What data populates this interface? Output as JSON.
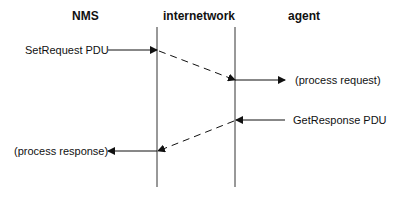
{
  "columns": {
    "nms": "NMS",
    "internetwork": "internetwork",
    "agent": "agent"
  },
  "messages": {
    "set_request": "SetRequest PDU",
    "process_request": "(process request)",
    "get_response": "GetResponse PDU",
    "process_response": "(process response)"
  }
}
